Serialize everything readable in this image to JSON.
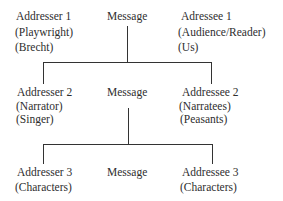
{
  "diagram": {
    "type": "communication-levels",
    "levels": [
      {
        "addresser": {
          "title": "Addresser 1",
          "role": "(Playwright)",
          "example": "(Brecht)"
        },
        "message": "Message",
        "addressee": {
          "title": "Adressee 1",
          "role": "(Audience/Reader)",
          "example": "(Us)"
        }
      },
      {
        "addresser": {
          "title": "Addresser 2",
          "role": "(Narrator)",
          "example": "(Singer)"
        },
        "message": "Message",
        "addressee": {
          "title": "Addressee 2",
          "role": "(Narratees)",
          "example": "(Peasants)"
        }
      },
      {
        "addresser": {
          "title": "Addresser 3",
          "role": "(Characters)"
        },
        "message": "Message",
        "addressee": {
          "title": "Addressee 3",
          "role": "(Characters)"
        }
      }
    ],
    "line_color": "#333333",
    "text_color": "#2e2e2e"
  }
}
